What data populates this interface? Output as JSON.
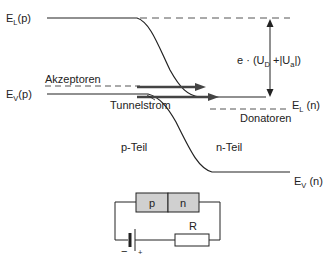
{
  "labels": {
    "el_p_main": "E",
    "el_p_sub": "L",
    "el_p_tail": "(p)",
    "ev_p_main": "E",
    "ev_p_sub": "V",
    "ev_p_tail": "(p)",
    "el_n_main": "E",
    "el_n_sub": "L",
    "el_n_tail": " (n)",
    "ev_n_main": "E",
    "ev_n_sub": "V",
    "ev_n_tail": " (n)",
    "akzeptoren": "Akzeptoren",
    "donatoren": "Donatoren",
    "tunnelstrom": "Tunnelstrom",
    "p_teil": "p-Teil",
    "n_teil": "n-Teil",
    "energy_a": "e · (U",
    "energy_sub_d": "D",
    "energy_b": " +|U",
    "energy_sub_a": "a",
    "energy_c": "|)"
  },
  "circuit": {
    "p_label": "p",
    "n_label": "n",
    "resistor_label": "R",
    "minus": "−",
    "plus": "+",
    "diode_fill": "#d0d0d0"
  },
  "colors": {
    "line": "#222222",
    "dash": "#555555",
    "arrow": "#444444"
  }
}
